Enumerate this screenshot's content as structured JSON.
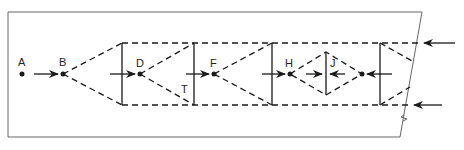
{
  "diagram": {
    "type": "network-flow",
    "colors": {
      "line": "#1a1a1a",
      "frame": "#555555",
      "background": "#ffffff"
    },
    "nodes": [
      {
        "id": "A",
        "label": "A"
      },
      {
        "id": "B",
        "label": "B"
      },
      {
        "id": "D",
        "label": "D"
      },
      {
        "id": "F",
        "label": "F"
      },
      {
        "id": "H",
        "label": "H"
      },
      {
        "id": "J",
        "label": "J"
      }
    ],
    "annotations": [
      {
        "label": "T"
      }
    ]
  }
}
